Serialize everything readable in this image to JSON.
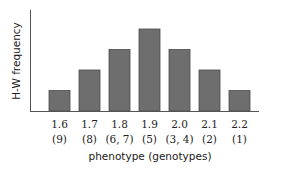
{
  "chart_data": {
    "type": "bar",
    "title": "",
    "xlabel": "phenotype (genotypes)",
    "ylabel": "H-W frequency",
    "categories": [
      "1.6",
      "1.7",
      "1.8",
      "1.9",
      "2.0",
      "2.1",
      "2.2"
    ],
    "genotypes": [
      "(9)",
      "(8)",
      "(6, 7)",
      "(5)",
      "(3, 4)",
      "(2)",
      "(1)"
    ],
    "values": [
      1,
      2,
      3,
      4,
      3,
      2,
      1
    ],
    "ylim": [
      0,
      5
    ],
    "grid": false,
    "legend": null,
    "colors": {
      "bar_fill": "#6e6e6e",
      "bar_edge": "#4a4a4a",
      "axis": "#555555"
    }
  }
}
